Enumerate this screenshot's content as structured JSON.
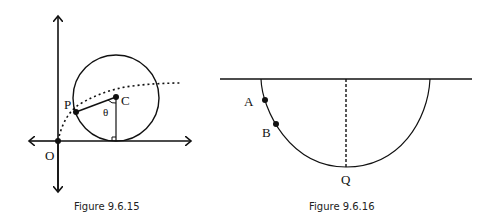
{
  "figures": [
    {
      "caption": "Figure 9.6.15",
      "labels": {
        "origin": "O",
        "point": "P",
        "center": "C",
        "angle": "θ"
      }
    },
    {
      "caption": "Figure 9.6.16",
      "labels": {
        "point_a": "A",
        "point_b": "B",
        "bottom": "Q"
      }
    }
  ]
}
